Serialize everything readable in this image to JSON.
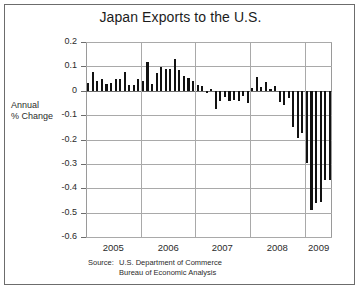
{
  "figure": {
    "title": "Japan Exports to the U.S.",
    "axis_title_line1": "Annual",
    "axis_title_line2": "% Change",
    "source_label": "Source:",
    "source_line1": "U.S. Department of Commerce",
    "source_line2": "Bureau of Economic Analysis"
  },
  "chart_data": {
    "type": "bar",
    "title": "Japan Exports to the U.S.",
    "xlabel": "",
    "ylabel": "Annual % Change",
    "ylim": [
      -0.6,
      0.2
    ],
    "ytick_labels": [
      "0.2",
      "0.1",
      "0",
      "-0.1",
      "-0.2",
      "-0.3",
      "-0.4",
      "-0.5",
      "-0.6"
    ],
    "ytick_values": [
      0.2,
      0.1,
      0,
      -0.1,
      -0.2,
      -0.3,
      -0.4,
      -0.5,
      -0.6
    ],
    "xtick_labels": [
      "2005",
      "2006",
      "2007",
      "2008",
      "2009"
    ],
    "xtick_values": [
      2005,
      2006,
      2007,
      2008,
      2009
    ],
    "grid": true,
    "legend": "none",
    "series_color": "#121212",
    "frequency": "monthly",
    "x": [
      "2005-01",
      "2005-02",
      "2005-03",
      "2005-04",
      "2005-05",
      "2005-06",
      "2005-07",
      "2005-08",
      "2005-09",
      "2005-10",
      "2005-11",
      "2005-12",
      "2006-01",
      "2006-02",
      "2006-03",
      "2006-04",
      "2006-05",
      "2006-06",
      "2006-07",
      "2006-08",
      "2006-09",
      "2006-10",
      "2006-11",
      "2006-12",
      "2007-01",
      "2007-02",
      "2007-03",
      "2007-04",
      "2007-05",
      "2007-06",
      "2007-07",
      "2007-08",
      "2007-09",
      "2007-10",
      "2007-11",
      "2007-12",
      "2008-01",
      "2008-02",
      "2008-03",
      "2008-04",
      "2008-05",
      "2008-06",
      "2008-07",
      "2008-08",
      "2008-09",
      "2008-10",
      "2008-11",
      "2008-12",
      "2009-01",
      "2009-02",
      "2009-03",
      "2009-04",
      "2009-05",
      "2009-06"
    ],
    "values": [
      0.03,
      0.077,
      0.04,
      0.047,
      0.029,
      0.03,
      0.048,
      0.05,
      0.076,
      0.022,
      0.022,
      0.048,
      0.038,
      0.116,
      0.029,
      0.073,
      0.097,
      0.089,
      0.09,
      0.132,
      0.086,
      0.06,
      0.052,
      0.041,
      0.025,
      0.021,
      -0.008,
      0.008,
      -0.076,
      -0.044,
      -0.026,
      -0.04,
      -0.036,
      -0.041,
      -0.021,
      -0.049,
      0.012,
      0.058,
      0.015,
      0.037,
      0.007,
      0.019,
      -0.048,
      -0.057,
      -0.031,
      -0.148,
      -0.193,
      -0.173,
      -0.296,
      -0.49,
      -0.46,
      -0.455,
      -0.368,
      -0.365
    ]
  }
}
